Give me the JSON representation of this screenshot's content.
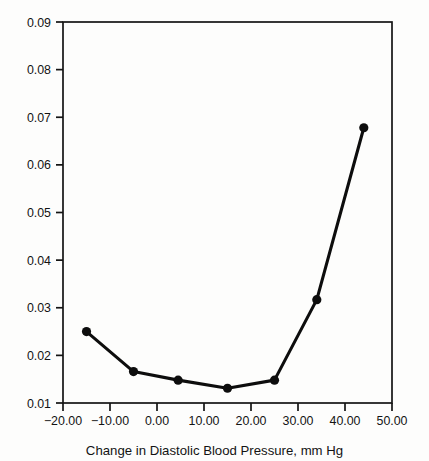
{
  "chart_data": {
    "type": "line",
    "title": "",
    "subtitle": "",
    "xlabel": "Change in Diastolic Blood Pressure, mm Hg",
    "ylabel": "",
    "xlim": [
      -20,
      50
    ],
    "ylim": [
      0.01,
      0.09
    ],
    "xticks": [
      -20,
      -10,
      0,
      10,
      20,
      30,
      40,
      50
    ],
    "xticklabels": [
      "−20.00",
      "−10.00",
      "0.00",
      "10.00",
      "20.00",
      "30.00",
      "40.00",
      "50.00"
    ],
    "yticks": [
      0.01,
      0.02,
      0.03,
      0.04,
      0.05,
      0.06,
      0.07,
      0.08,
      0.09
    ],
    "yticklabels": [
      "0.01",
      "0.02",
      "0.03",
      "0.04",
      "0.05",
      "0.06",
      "0.07",
      "0.08",
      "0.09"
    ],
    "grid": false,
    "legend": null,
    "legend_position": "none",
    "marker": "filled-circle",
    "line_color": "#0d0d0d",
    "marker_color": "#0d0d0d",
    "frame": true,
    "tick_direction": "out",
    "x": [
      -15,
      -5,
      4.5,
      15,
      25,
      34,
      44
    ],
    "values": [
      0.025,
      0.0166,
      0.0148,
      0.0131,
      0.0148,
      0.0317,
      0.0678
    ],
    "points": [
      {
        "x": -15,
        "y": 0.025
      },
      {
        "x": -5,
        "y": 0.0166
      },
      {
        "x": 4.5,
        "y": 0.0148
      },
      {
        "x": 15,
        "y": 0.0131
      },
      {
        "x": 25,
        "y": 0.0148
      },
      {
        "x": 34,
        "y": 0.0317
      },
      {
        "x": 44,
        "y": 0.0678
      }
    ],
    "annotations": []
  },
  "figure": {
    "background_color": "#fdfdfc",
    "foreground_color": "#131313"
  }
}
